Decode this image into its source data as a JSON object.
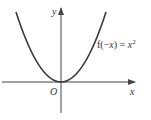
{
  "diagram": {
    "type": "function-graph",
    "axes": {
      "x_label": "x",
      "y_label": "y",
      "origin_label": "O"
    },
    "curve": {
      "equation_prefix": "f(−",
      "equation_var": "x",
      "equation_mid": ") = ",
      "equation_base": "x",
      "equation_exp": "2",
      "shape": "parabola-opening-upward",
      "vertex": "origin"
    },
    "colors": {
      "curve": "#3a3a3a",
      "axes": "#444444",
      "text": "#333333",
      "background": "#ffffff"
    }
  }
}
